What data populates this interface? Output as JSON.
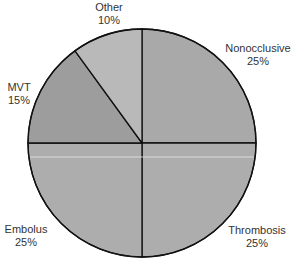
{
  "chart_data": {
    "type": "pie",
    "title": "",
    "categories": [
      "Nonocclusive",
      "Thrombosis",
      "Embolus",
      "MVT",
      "Other"
    ],
    "values": [
      25,
      25,
      25,
      15,
      10
    ],
    "unit": "%",
    "start_angle_deg": 0,
    "direction": "clockwise",
    "colors": [
      "#a9a9a9",
      "#adadad",
      "#adadad",
      "#9d9d9d",
      "#b9b9b9"
    ],
    "labels": [
      {
        "name": "Nonocclusive",
        "value": "25%"
      },
      {
        "name": "Thrombosis",
        "value": "25%"
      },
      {
        "name": "Embolus",
        "value": "25%"
      },
      {
        "name": "MVT",
        "value": "15%"
      },
      {
        "name": "Other",
        "value": "10%"
      }
    ],
    "legend": "none",
    "grid": false
  },
  "style": {
    "stroke_color": "#111111",
    "highlight_line_color": "#e6e6e6"
  }
}
